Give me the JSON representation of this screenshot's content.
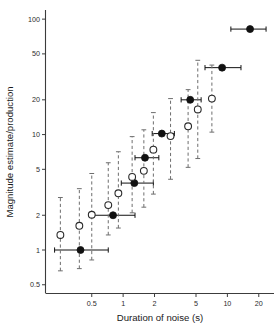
{
  "figure": {
    "background": "#ffffff",
    "ink_color": "#111111",
    "errorbar_color": "#6e6e6e"
  },
  "chart_data": {
    "type": "scatter",
    "title": "",
    "xlabel": "Duration of noise (s)",
    "ylabel": "Magnitude  estimate/production",
    "xscale": "log",
    "yscale": "log",
    "grid": false,
    "legend_position": "none",
    "xlim": [
      0.18,
      28
    ],
    "ylim": [
      0.42,
      120
    ],
    "xticks": [
      0.5,
      1,
      2,
      5,
      10,
      20
    ],
    "xtick_labels": [
      "0.5",
      "1",
      "2",
      "5",
      "10",
      "20"
    ],
    "yticks": [
      0.5,
      1,
      2,
      5,
      10,
      20,
      50,
      100
    ],
    "ytick_labels": [
      "0.5",
      "1",
      "2",
      "5",
      "10",
      "20",
      "50",
      "100"
    ],
    "series": [
      {
        "name": "production",
        "marker": "filled-circle",
        "errorbars": "horizontal",
        "points": [
          {
            "x": 0.39,
            "y": 1.0,
            "xlo": 0.22,
            "xhi": 0.72
          },
          {
            "x": 0.8,
            "y": 2.0,
            "xlo": 0.49,
            "xhi": 1.3
          },
          {
            "x": 1.28,
            "y": 3.8,
            "xlo": 0.96,
            "xhi": 1.95
          },
          {
            "x": 1.62,
            "y": 6.3,
            "xlo": 1.3,
            "xhi": 2.2
          },
          {
            "x": 2.35,
            "y": 10.2,
            "xlo": 1.9,
            "xhi": 3.1
          },
          {
            "x": 4.4,
            "y": 20.0,
            "xlo": 3.6,
            "xhi": 5.6
          },
          {
            "x": 8.9,
            "y": 38.0,
            "xlo": 6.1,
            "xhi": 13.5
          },
          {
            "x": 16.5,
            "y": 82.0,
            "xlo": 10.8,
            "xhi": 23.5
          }
        ]
      },
      {
        "name": "magnitude-estimate",
        "marker": "open-circle",
        "errorbars": "vertical-dashed",
        "points": [
          {
            "x": 0.25,
            "y": 1.35,
            "ylo": 0.66,
            "yhi": 2.85
          },
          {
            "x": 0.38,
            "y": 1.62,
            "ylo": 0.69,
            "yhi": 3.4
          },
          {
            "x": 0.5,
            "y": 2.02,
            "ylo": 0.82,
            "yhi": 4.6
          },
          {
            "x": 0.72,
            "y": 2.45,
            "ylo": 1.35,
            "yhi": 5.7
          },
          {
            "x": 0.9,
            "y": 3.1,
            "ylo": 1.55,
            "yhi": 7.1
          },
          {
            "x": 1.22,
            "y": 4.3,
            "ylo": 2.1,
            "yhi": 9.6
          },
          {
            "x": 1.58,
            "y": 4.85,
            "ylo": 2.35,
            "yhi": 11.0
          },
          {
            "x": 1.95,
            "y": 7.4,
            "ylo": 3.05,
            "yhi": 15.5
          },
          {
            "x": 2.85,
            "y": 9.7,
            "ylo": 4.1,
            "yhi": 20.5
          },
          {
            "x": 4.2,
            "y": 11.8,
            "ylo": 5.2,
            "yhi": 24.5
          },
          {
            "x": 5.2,
            "y": 16.5,
            "ylo": 6.2,
            "yhi": 44.0
          },
          {
            "x": 7.1,
            "y": 20.5,
            "ylo": 10.5,
            "yhi": 40.0
          }
        ]
      }
    ]
  }
}
